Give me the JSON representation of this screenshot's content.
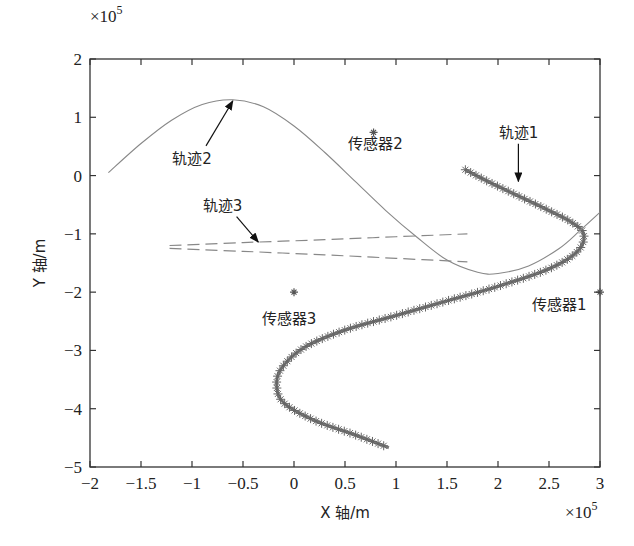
{
  "chart_data": {
    "type": "line",
    "title": "",
    "xlabel": "X 轴/m",
    "ylabel": "Y 轴/m",
    "x_exponent": "×10^5",
    "y_exponent": "×10^5",
    "xlim": [
      -2,
      3
    ],
    "ylim": [
      -5,
      2
    ],
    "xticks": [
      -2,
      -1.5,
      -1,
      -0.5,
      0,
      0.5,
      1,
      1.5,
      2,
      2.5,
      3
    ],
    "xtick_labels": [
      "-2",
      "-1.5",
      "-1",
      "-0.5",
      "0",
      "0.5",
      "1",
      "1.5",
      "2",
      "2.5",
      "3"
    ],
    "yticks": [
      -5,
      -4,
      -3,
      -2,
      -1,
      0,
      1,
      2
    ],
    "ytick_labels": [
      "-5",
      "-4",
      "-3",
      "-2",
      "-1",
      "0",
      "1",
      "2"
    ],
    "grid": false,
    "series": [
      {
        "name": "轨迹1",
        "style": "solid-star-markers",
        "color": "#777777",
        "x": [
          1.68,
          1.9,
          2.2,
          2.5,
          2.72,
          2.84,
          2.78,
          2.5,
          2.0,
          1.5,
          1.0,
          0.5,
          0.1,
          -0.12,
          -0.17,
          -0.1,
          0.2,
          0.6,
          0.93
        ],
        "y": [
          0.1,
          -0.1,
          -0.35,
          -0.6,
          -0.8,
          -1.0,
          -1.3,
          -1.6,
          -1.9,
          -2.15,
          -2.4,
          -2.65,
          -2.95,
          -3.3,
          -3.6,
          -3.9,
          -4.2,
          -4.45,
          -4.67
        ]
      },
      {
        "name": "轨迹2",
        "style": "thin-solid",
        "color": "#888888",
        "x": [
          -1.82,
          -1.5,
          -1.2,
          -0.9,
          -0.6,
          -0.3,
          0.0,
          0.3,
          0.6,
          0.9,
          1.2,
          1.5,
          1.8,
          2.0,
          2.3,
          2.6,
          2.8,
          3.0
        ],
        "y": [
          0.05,
          0.55,
          0.95,
          1.22,
          1.3,
          1.18,
          0.85,
          0.4,
          -0.1,
          -0.6,
          -1.05,
          -1.45,
          -1.66,
          -1.68,
          -1.55,
          -1.25,
          -0.95,
          -0.63
        ]
      },
      {
        "name": "轨迹3",
        "style": "dashed",
        "color": "#888888",
        "branches": [
          {
            "x": [
              -1.22,
              -0.5,
              0.3,
              1.0,
              1.7
            ],
            "y": [
              -1.2,
              -1.15,
              -1.1,
              -1.05,
              -1.0
            ]
          },
          {
            "x": [
              -1.22,
              -0.5,
              0.3,
              1.0,
              1.7
            ],
            "y": [
              -1.25,
              -1.3,
              -1.36,
              -1.42,
              -1.48
            ]
          }
        ]
      }
    ],
    "sensors": [
      {
        "name": "传感器1",
        "x": 3.0,
        "y": -2.0
      },
      {
        "name": "传感器2",
        "x": 0.78,
        "y": 0.74
      },
      {
        "name": "传感器3",
        "x": 0.0,
        "y": -2.0
      }
    ],
    "annotations": [
      {
        "text": "轨迹1",
        "label_x": 2.2,
        "label_y": 0.65,
        "arrow_to_x": 2.2,
        "arrow_to_y": -0.1
      },
      {
        "text": "轨迹2",
        "label_x": -1.0,
        "label_y": 0.2,
        "arrow_to_x": -0.6,
        "arrow_to_y": 1.28
      },
      {
        "text": "轨迹3",
        "label_x": -0.7,
        "label_y": -0.6,
        "arrow_to_x": -0.35,
        "arrow_to_y": -1.14
      },
      {
        "text": "传感器1",
        "label_x": 2.6,
        "label_y": -2.3
      },
      {
        "text": "传感器2",
        "label_x": 0.8,
        "label_y": 0.45
      },
      {
        "text": "传感器3",
        "label_x": -0.05,
        "label_y": -2.55
      }
    ]
  }
}
